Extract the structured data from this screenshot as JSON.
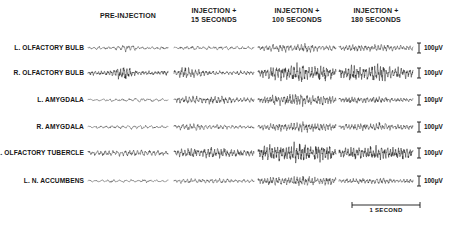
{
  "figure": {
    "kind": "electrophysiology-recording-chart",
    "columns": [
      {
        "id": "pre-injection",
        "label": "PRE-INJECTION",
        "x": 88,
        "width": 80
      },
      {
        "id": "injection-15s",
        "label": "INJECTION +\n15  SECONDS",
        "x": 174,
        "width": 80
      },
      {
        "id": "injection-100s",
        "label": "INJECTION +\n100  SECONDS",
        "x": 258,
        "width": 78
      },
      {
        "id": "injection-180s",
        "label": "INJECTION +\n180  SECONDS",
        "x": 339,
        "width": 74
      }
    ],
    "rows": [
      {
        "id": "l-olfactory-bulb",
        "label": "L. OLFACTORY BULB",
        "y": 48
      },
      {
        "id": "r-olfactory-bulb",
        "label": "R. OLFACTORY BULB",
        "y": 73
      },
      {
        "id": "l-amygdala",
        "label": "L. AMYGDALA",
        "y": 100
      },
      {
        "id": "r-amygdala",
        "label": "R. AMYGDALA",
        "y": 127
      },
      {
        "id": "l-olfactory-tubercle",
        "label": "L. OLFACTORY TUBERCLE",
        "y": 153
      },
      {
        "id": "l-n-accumbens",
        "label": "L. N. ACCUMBENS",
        "y": 181
      }
    ],
    "amplitude_scale": {
      "label": "100μV",
      "value": 100,
      "unit": "μV",
      "count": 6,
      "x": 419
    },
    "time_scale": {
      "label": "1 SECOND",
      "value": 1,
      "unit": "SECOND",
      "x": 352,
      "y": 206,
      "width": 68
    }
  },
  "chart_data": {
    "type": "line",
    "title": "",
    "xlabel": "",
    "ylabel": "",
    "grid": false,
    "legend": false,
    "x": [
      "PRE-INJECTION",
      "INJECTION + 15 SECONDS",
      "INJECTION + 100 SECONDS",
      "INJECTION + 180 SECONDS"
    ],
    "categories": [
      "L. OLFACTORY BULB",
      "R. OLFACTORY BULB",
      "L. AMYGDALA",
      "R. AMYGDALA",
      "L. OLFACTORY TUBERCLE",
      "L. N. ACCUMBENS"
    ],
    "yscale_uV": 100,
    "xscale_seconds": 1,
    "series": [
      {
        "name": "L. OLFACTORY BULB",
        "segments": [
          {
            "epoch": "PRE-INJECTION",
            "amplitude_uV": 38,
            "base_uV": 10,
            "freq_hz": 30,
            "burst_center": 0.47,
            "burst_width": 0.17,
            "density": 1.0,
            "ink": 0.55
          },
          {
            "epoch": "INJECTION + 15 SECONDS",
            "amplitude_uV": 16,
            "base_uV": 9,
            "freq_hz": 26,
            "burst_center": 0.5,
            "burst_width": 0.8,
            "density": 0.9,
            "ink": 0.45
          },
          {
            "epoch": "INJECTION + 100 SECONDS",
            "amplitude_uV": 34,
            "base_uV": 12,
            "freq_hz": 40,
            "burst_center": 0.5,
            "burst_width": 0.9,
            "density": 1.25,
            "ink": 0.45
          },
          {
            "epoch": "INJECTION + 180 SECONDS",
            "amplitude_uV": 30,
            "base_uV": 12,
            "freq_hz": 42,
            "burst_center": 0.42,
            "burst_width": 0.85,
            "density": 1.3,
            "ink": 0.5
          }
        ]
      },
      {
        "name": "R. OLFACTORY BULB",
        "segments": [
          {
            "epoch": "PRE-INJECTION",
            "amplitude_uV": 72,
            "base_uV": 14,
            "freq_hz": 46,
            "burst_center": 0.42,
            "burst_width": 0.17,
            "density": 1.6,
            "ink": 0.85
          },
          {
            "epoch": "INJECTION + 15 SECONDS",
            "amplitude_uV": 52,
            "base_uV": 14,
            "freq_hz": 42,
            "burst_center": 0.18,
            "burst_width": 0.3,
            "density": 1.4,
            "ink": 0.7
          },
          {
            "epoch": "INJECTION + 100 SECONDS",
            "amplitude_uV": 80,
            "base_uV": 16,
            "freq_hz": 48,
            "burst_center": 0.55,
            "burst_width": 0.75,
            "density": 1.6,
            "ink": 0.7
          },
          {
            "epoch": "INJECTION + 180 SECONDS",
            "amplitude_uV": 70,
            "base_uV": 16,
            "freq_hz": 46,
            "burst_center": 0.45,
            "burst_width": 0.85,
            "density": 1.55,
            "ink": 0.8
          }
        ]
      },
      {
        "name": "L. AMYGDALA",
        "segments": [
          {
            "epoch": "PRE-INJECTION",
            "amplitude_uV": 16,
            "base_uV": 8,
            "freq_hz": 22,
            "burst_center": 0.6,
            "burst_width": 0.55,
            "density": 0.85,
            "ink": 0.45
          },
          {
            "epoch": "INJECTION + 15 SECONDS",
            "amplitude_uV": 34,
            "base_uV": 12,
            "freq_hz": 40,
            "burst_center": 0.35,
            "burst_width": 0.8,
            "density": 1.35,
            "ink": 0.6
          },
          {
            "epoch": "INJECTION + 100 SECONDS",
            "amplitude_uV": 48,
            "base_uV": 14,
            "freq_hz": 50,
            "burst_center": 0.5,
            "burst_width": 0.9,
            "density": 1.6,
            "ink": 0.5
          },
          {
            "epoch": "INJECTION + 180 SECONDS",
            "amplitude_uV": 30,
            "base_uV": 11,
            "freq_hz": 44,
            "burst_center": 0.3,
            "burst_width": 0.7,
            "density": 1.4,
            "ink": 0.6
          }
        ]
      },
      {
        "name": "R. AMYGDALA",
        "segments": [
          {
            "epoch": "PRE-INJECTION",
            "amplitude_uV": 15,
            "base_uV": 8,
            "freq_hz": 26,
            "burst_center": 0.55,
            "burst_width": 0.6,
            "density": 0.95,
            "ink": 0.45
          },
          {
            "epoch": "INJECTION + 15 SECONDS",
            "amplitude_uV": 26,
            "base_uV": 10,
            "freq_hz": 38,
            "burst_center": 0.25,
            "burst_width": 0.7,
            "density": 1.2,
            "ink": 0.45
          },
          {
            "epoch": "INJECTION + 100 SECONDS",
            "amplitude_uV": 42,
            "base_uV": 12,
            "freq_hz": 48,
            "burst_center": 0.6,
            "burst_width": 0.85,
            "density": 1.5,
            "ink": 0.4
          },
          {
            "epoch": "INJECTION + 180 SECONDS",
            "amplitude_uV": 32,
            "base_uV": 11,
            "freq_hz": 44,
            "burst_center": 0.45,
            "burst_width": 0.85,
            "density": 1.4,
            "ink": 0.5
          }
        ]
      },
      {
        "name": "L. OLFACTORY TUBERCLE",
        "segments": [
          {
            "epoch": "PRE-INJECTION",
            "amplitude_uV": 28,
            "base_uV": 12,
            "freq_hz": 36,
            "burst_center": 0.55,
            "burst_width": 0.7,
            "density": 1.3,
            "ink": 0.65
          },
          {
            "epoch": "INJECTION + 15 SECONDS",
            "amplitude_uV": 46,
            "base_uV": 14,
            "freq_hz": 44,
            "burst_center": 0.4,
            "burst_width": 0.85,
            "density": 1.5,
            "ink": 0.7
          },
          {
            "epoch": "INJECTION + 100 SECONDS",
            "amplitude_uV": 78,
            "base_uV": 20,
            "freq_hz": 52,
            "burst_center": 0.5,
            "burst_width": 0.95,
            "density": 1.75,
            "ink": 0.8
          },
          {
            "epoch": "INJECTION + 180 SECONDS",
            "amplitude_uV": 56,
            "base_uV": 18,
            "freq_hz": 48,
            "burst_center": 0.5,
            "burst_width": 0.95,
            "density": 1.7,
            "ink": 0.85
          }
        ]
      },
      {
        "name": "L. N. ACCUMBENS",
        "segments": [
          {
            "epoch": "PRE-INJECTION",
            "amplitude_uV": 14,
            "base_uV": 7,
            "freq_hz": 24,
            "burst_center": 0.5,
            "burst_width": 0.6,
            "density": 0.9,
            "ink": 0.45
          },
          {
            "epoch": "INJECTION + 15 SECONDS",
            "amplitude_uV": 20,
            "base_uV": 9,
            "freq_hz": 36,
            "burst_center": 0.4,
            "burst_width": 0.75,
            "density": 1.2,
            "ink": 0.45
          },
          {
            "epoch": "INJECTION + 100 SECONDS",
            "amplitude_uV": 40,
            "base_uV": 12,
            "freq_hz": 48,
            "burst_center": 0.5,
            "burst_width": 0.9,
            "density": 1.5,
            "ink": 0.45
          },
          {
            "epoch": "INJECTION + 180 SECONDS",
            "amplitude_uV": 24,
            "base_uV": 10,
            "freq_hz": 40,
            "burst_center": 0.5,
            "burst_width": 0.9,
            "density": 1.35,
            "ink": 0.6
          }
        ]
      }
    ]
  }
}
